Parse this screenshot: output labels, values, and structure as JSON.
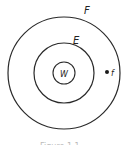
{
  "diagram": {
    "type": "concentric-circles",
    "center": [
      64,
      73
    ],
    "circles": [
      {
        "name": "outer",
        "label": "F",
        "radius": 56
      },
      {
        "name": "middle",
        "label": "E",
        "radius": 30
      },
      {
        "name": "inner",
        "label": "W",
        "radius": 11
      }
    ],
    "point": {
      "label": "f",
      "position": [
        107,
        72
      ]
    },
    "caption": "Figure 1.1",
    "stroke_color": "#2a2a2a"
  }
}
